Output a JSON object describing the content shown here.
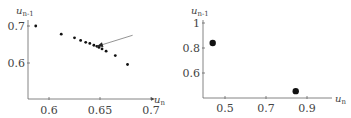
{
  "chart_data": [
    {
      "type": "scatter",
      "title": "",
      "xlabel": "u_n",
      "ylabel": "u_{n-1}",
      "xlabel_main": "u",
      "xlabel_sub": "n",
      "ylabel_main": "u",
      "ylabel_sub": "n-1",
      "xlim": [
        0.58,
        0.705
      ],
      "ylim": [
        0.555,
        0.705
      ],
      "xticks": [
        0.6,
        0.65,
        0.7
      ],
      "xtick_labels": [
        "0.6",
        "0.65",
        "0.7"
      ],
      "yticks": [
        0.6,
        0.7
      ],
      "ytick_labels": [
        "0.6",
        "0.7"
      ],
      "grid": false,
      "points": [
        {
          "x": 0.587,
          "y": 0.7
        },
        {
          "x": 0.612,
          "y": 0.678
        },
        {
          "x": 0.625,
          "y": 0.668
        },
        {
          "x": 0.631,
          "y": 0.661
        },
        {
          "x": 0.636,
          "y": 0.656
        },
        {
          "x": 0.64,
          "y": 0.653
        },
        {
          "x": 0.644,
          "y": 0.648
        },
        {
          "x": 0.647,
          "y": 0.645
        },
        {
          "x": 0.649,
          "y": 0.642
        },
        {
          "x": 0.652,
          "y": 0.638
        },
        {
          "x": 0.656,
          "y": 0.632
        },
        {
          "x": 0.665,
          "y": 0.62
        },
        {
          "x": 0.677,
          "y": 0.596
        }
      ],
      "annotation": {
        "type": "arrow",
        "from": {
          "x": 0.682,
          "y": 0.675
        },
        "to": {
          "x": 0.647,
          "y": 0.645
        }
      }
    },
    {
      "type": "scatter",
      "title": "",
      "xlabel": "u_n",
      "ylabel": "u_{n-1}",
      "xlabel_main": "u",
      "xlabel_sub": "n",
      "ylabel_main": "u",
      "ylabel_sub": "n-1",
      "xlim": [
        0.39,
        1.05
      ],
      "ylim": [
        0.4,
        1.0
      ],
      "xticks": [
        0.5,
        0.7,
        0.9
      ],
      "xtick_labels": [
        "0.5",
        "0.7",
        "0.9"
      ],
      "yticks": [
        0.6,
        0.8,
        1.0
      ],
      "ytick_labels": [
        "0.6",
        "0.8",
        "1"
      ],
      "grid": false,
      "points": [
        {
          "x": 0.44,
          "y": 0.84
        },
        {
          "x": 0.845,
          "y": 0.455
        }
      ]
    }
  ]
}
